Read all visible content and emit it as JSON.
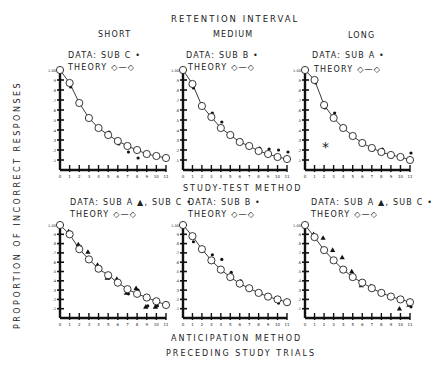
{
  "figure": {
    "top_title": "RETENTION INTERVAL",
    "row_titles": [
      "STUDY-TEST METHOD",
      "ANTICIPATION METHOD"
    ],
    "x_title": "PRECEDING STUDY TRIALS",
    "y_title": "PROPORTION OF INCORRECT RESPONSES",
    "column_titles": [
      "SHORT",
      "MEDIUM",
      "LONG"
    ]
  },
  "panels": [
    {
      "col_title": "SHORT",
      "data_label": "DATA: SUB C •",
      "theory_label": "THEORY ◇—◇"
    },
    {
      "col_title": "MEDIUM",
      "data_label": "DATA: SUB B •",
      "theory_label": "THEORY ◇—◇"
    },
    {
      "col_title": "LONG",
      "data_label": "DATA: SUB A •",
      "theory_label": "THEORY ◇—◇",
      "annotation": "*"
    },
    {
      "data_label": "DATA: SUB A ▲, SUB C •",
      "theory_label": "THEORY ◇—◇"
    },
    {
      "data_label": "DATA: SUB B •",
      "theory_label": "THEORY ◇—◇"
    },
    {
      "data_label": "DATA: SUB A ▲, SUB C •",
      "theory_label": "THEORY ◇—◇"
    }
  ],
  "chart_data": [
    {
      "type": "line",
      "title": "Study-Test Method, Short Retention Interval",
      "xlabel": "Preceding Study Trials",
      "ylabel": "Proportion of Incorrect Responses",
      "x": [
        0,
        1,
        2,
        3,
        4,
        5,
        6,
        7,
        8,
        9,
        10,
        11
      ],
      "xlim": [
        0,
        11
      ],
      "ylim": [
        0,
        1.0
      ],
      "yticks": [
        0.1,
        0.2,
        0.3,
        0.4,
        0.5,
        0.6,
        0.7,
        0.8,
        0.9,
        1.0
      ],
      "series": [
        {
          "name": "Theory",
          "marker": "open-circle",
          "values": [
            1.0,
            0.87,
            0.67,
            0.52,
            0.42,
            0.35,
            0.29,
            0.24,
            0.2,
            0.16,
            0.14,
            0.12
          ]
        },
        {
          "name": "Sub C",
          "marker": "dot",
          "values": [
            1.0,
            0.83,
            0.67,
            0.52,
            0.43,
            0.38,
            0.26,
            0.18,
            0.12,
            0.16,
            0.13,
            null
          ]
        }
      ]
    },
    {
      "type": "line",
      "title": "Study-Test Method, Medium Retention Interval",
      "xlabel": "Preceding Study Trials",
      "ylabel": "Proportion of Incorrect Responses",
      "x": [
        0,
        1,
        2,
        3,
        4,
        5,
        6,
        7,
        8,
        9,
        10,
        11
      ],
      "xlim": [
        0,
        11
      ],
      "ylim": [
        0,
        1.0
      ],
      "yticks": [
        0.1,
        0.2,
        0.3,
        0.4,
        0.5,
        0.6,
        0.7,
        0.8,
        0.9,
        1.0
      ],
      "series": [
        {
          "name": "Theory",
          "marker": "open-circle",
          "values": [
            1.0,
            0.86,
            0.64,
            0.53,
            0.42,
            0.35,
            0.28,
            0.24,
            0.19,
            0.16,
            0.13,
            0.11
          ]
        },
        {
          "name": "Sub B",
          "marker": "dot",
          "values": [
            1.0,
            0.82,
            0.64,
            0.57,
            0.48,
            0.36,
            0.3,
            0.23,
            0.22,
            0.21,
            0.2,
            0.18
          ]
        }
      ]
    },
    {
      "type": "line",
      "title": "Study-Test Method, Long Retention Interval",
      "xlabel": "Preceding Study Trials",
      "ylabel": "Proportion of Incorrect Responses",
      "x": [
        0,
        1,
        2,
        3,
        4,
        5,
        6,
        7,
        8,
        9,
        10,
        11
      ],
      "xlim": [
        0,
        11
      ],
      "ylim": [
        0,
        1.0
      ],
      "yticks": [
        0.1,
        0.2,
        0.3,
        0.4,
        0.5,
        0.6,
        0.7,
        0.8,
        0.9,
        1.0
      ],
      "annotation": "*",
      "series": [
        {
          "name": "Theory",
          "marker": "open-circle",
          "values": [
            1.0,
            0.9,
            0.65,
            0.52,
            0.42,
            0.34,
            0.27,
            0.22,
            0.18,
            0.15,
            0.13,
            0.1
          ]
        },
        {
          "name": "Sub A",
          "marker": "dot",
          "values": [
            1.0,
            0.87,
            0.62,
            0.57,
            0.41,
            0.33,
            0.28,
            0.2,
            0.21,
            0.13,
            0.12,
            0.17
          ]
        }
      ]
    },
    {
      "type": "line",
      "title": "Anticipation Method, Short Retention Interval",
      "xlabel": "Preceding Study Trials",
      "ylabel": "Proportion of Incorrect Responses",
      "x": [
        0,
        1,
        2,
        3,
        4,
        5,
        6,
        7,
        8,
        9,
        10,
        11
      ],
      "xlim": [
        0,
        11
      ],
      "ylim": [
        0,
        1.0
      ],
      "yticks": [
        0.1,
        0.2,
        0.3,
        0.4,
        0.5,
        0.6,
        0.7,
        0.8,
        0.9,
        1.0
      ],
      "series": [
        {
          "name": "Theory",
          "marker": "open-circle",
          "values": [
            1.0,
            0.9,
            0.74,
            0.63,
            0.53,
            0.46,
            0.38,
            0.31,
            0.26,
            0.22,
            0.18,
            0.14
          ]
        },
        {
          "name": "Sub A",
          "marker": "triangle",
          "values": [
            1.0,
            0.93,
            0.79,
            0.71,
            0.57,
            0.43,
            0.42,
            0.27,
            0.32,
            0.12,
            0.12,
            0.15
          ]
        },
        {
          "name": "Sub C",
          "marker": "dot",
          "values": [
            1.0,
            0.92,
            0.77,
            0.64,
            0.55,
            0.43,
            0.38,
            0.26,
            0.3,
            0.13,
            0.13,
            0.16
          ]
        }
      ]
    },
    {
      "type": "line",
      "title": "Anticipation Method, Medium Retention Interval",
      "xlabel": "Preceding Study Trials",
      "ylabel": "Proportion of Incorrect Responses",
      "x": [
        0,
        1,
        2,
        3,
        4,
        5,
        6,
        7,
        8,
        9,
        10,
        11
      ],
      "xlim": [
        0,
        11
      ],
      "ylim": [
        0,
        1.0
      ],
      "yticks": [
        0.1,
        0.2,
        0.3,
        0.4,
        0.5,
        0.6,
        0.7,
        0.8,
        0.9,
        1.0
      ],
      "series": [
        {
          "name": "Theory",
          "marker": "open-circle",
          "values": [
            1.0,
            0.88,
            0.74,
            0.62,
            0.52,
            0.44,
            0.37,
            0.32,
            0.27,
            0.23,
            0.2,
            0.17
          ]
        },
        {
          "name": "Sub B",
          "marker": "dot",
          "values": [
            1.0,
            0.82,
            0.72,
            0.68,
            0.63,
            0.49,
            0.4,
            0.31,
            0.26,
            0.23,
            0.16,
            0.15
          ]
        }
      ]
    },
    {
      "type": "line",
      "title": "Anticipation Method, Long Retention Interval",
      "xlabel": "Preceding Study Trials",
      "ylabel": "Proportion of Incorrect Responses",
      "x": [
        0,
        1,
        2,
        3,
        4,
        5,
        6,
        7,
        8,
        9,
        10,
        11
      ],
      "xlim": [
        0,
        11
      ],
      "ylim": [
        0,
        1.0
      ],
      "yticks": [
        0.1,
        0.2,
        0.3,
        0.4,
        0.5,
        0.6,
        0.7,
        0.8,
        0.9,
        1.0
      ],
      "series": [
        {
          "name": "Theory",
          "marker": "open-circle",
          "values": [
            1.0,
            0.87,
            0.73,
            0.62,
            0.52,
            0.44,
            0.38,
            0.32,
            0.27,
            0.23,
            0.2,
            0.17
          ]
        },
        {
          "name": "Sub A",
          "marker": "triangle",
          "values": [
            1.0,
            0.9,
            0.86,
            0.73,
            0.65,
            0.5,
            0.35,
            0.34,
            0.27,
            0.23,
            0.1,
            0.14
          ]
        },
        {
          "name": "Sub C",
          "marker": "dot",
          "values": [
            1.0,
            0.88,
            0.72,
            0.62,
            0.52,
            0.44,
            0.36,
            0.34,
            0.26,
            0.22,
            0.2,
            0.12
          ]
        }
      ]
    }
  ]
}
